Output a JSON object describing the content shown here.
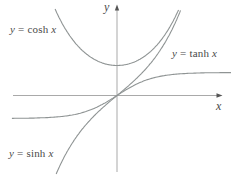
{
  "figure_title": "Graphs of hyperbolic functions",
  "colors": {
    "curve": "#8f9494",
    "axis_line": "#a9a9a9",
    "arrow": "#555555",
    "text": "#4a4a4a",
    "background": "#ffffff"
  },
  "labels": {
    "cosh": {
      "var": "y",
      "eq": " = ",
      "fn": "cosh ",
      "arg": "x"
    },
    "tanh": {
      "var": "y",
      "eq": " = ",
      "fn": "tanh ",
      "arg": "x"
    },
    "sinh": {
      "var": "y",
      "eq": " = ",
      "fn": "sinh ",
      "arg": "x"
    },
    "x_axis": "x",
    "y_axis": "y"
  },
  "chart_data": {
    "type": "line",
    "title": "",
    "xlabel": "x",
    "ylabel": "y",
    "axes": {
      "style": "centered-with-arrows",
      "x_range": [
        -3.3,
        3.2
      ],
      "y_range": [
        -2.9,
        3.0
      ],
      "ticks": "none",
      "grid": false
    },
    "legend": "inline-labels",
    "series": [
      {
        "name": "y = cosh x",
        "expression": "cosh(x)",
        "domain": [
          -1.72,
          1.71
        ],
        "sample_points": [
          [
            -1.5,
            2.35
          ],
          [
            -1,
            1.54
          ],
          [
            -0.5,
            1.13
          ],
          [
            0,
            1
          ],
          [
            0.5,
            1.13
          ],
          [
            1,
            1.54
          ],
          [
            1.5,
            2.35
          ]
        ]
      },
      {
        "name": "y = sinh x",
        "expression": "sinh(x)",
        "domain": [
          -1.69,
          1.765
        ],
        "sample_points": [
          [
            -1.5,
            -2.13
          ],
          [
            -1,
            -1.18
          ],
          [
            -0.5,
            -0.52
          ],
          [
            0,
            0
          ],
          [
            0.5,
            0.52
          ],
          [
            1,
            1.18
          ],
          [
            1.5,
            2.13
          ]
        ]
      },
      {
        "name": "y = tanh x",
        "expression": "tanh(x)",
        "domain": [
          -2.92,
          3.17
        ],
        "sample_points": [
          [
            -2,
            -0.96
          ],
          [
            -1,
            -0.76
          ],
          [
            0,
            0
          ],
          [
            1,
            0.76
          ],
          [
            2,
            0.96
          ]
        ],
        "asymptotes": [
          1,
          -1
        ]
      }
    ]
  }
}
